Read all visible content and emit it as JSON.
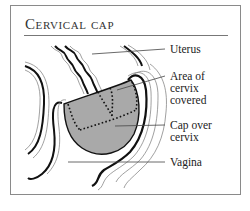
{
  "title": "Cervical cap",
  "colors": {
    "frame": "#8a8a8a",
    "cap_fill": "#a9a9a9",
    "ink": "#111111",
    "leader": "#444444"
  },
  "labels": [
    {
      "id": "uterus",
      "text": "Uterus"
    },
    {
      "id": "area-of-cervix-covered",
      "text": "Area of\ncervix\ncovered"
    },
    {
      "id": "cap-over-cervix",
      "text": "Cap over\ncervix"
    },
    {
      "id": "vagina",
      "text": "Vagina"
    }
  ]
}
